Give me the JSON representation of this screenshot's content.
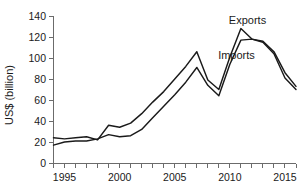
{
  "chart_data": {
    "type": "line",
    "title": "",
    "xlabel": "",
    "ylabel": "US$ (billion)",
    "xlim": [
      1994,
      2016
    ],
    "ylim": [
      0,
      140
    ],
    "grid": false,
    "legend_position": "inline-annotation",
    "x": [
      1994,
      1995,
      1996,
      1997,
      1998,
      1999,
      2000,
      2001,
      2002,
      2003,
      2004,
      2005,
      2006,
      2007,
      2008,
      2009,
      2010,
      2011,
      2012,
      2013,
      2014,
      2015,
      2016
    ],
    "x_tick_labels": [
      "1995",
      "2000",
      "2005",
      "2010",
      "2015"
    ],
    "x_tick_values": [
      1995,
      2000,
      2005,
      2010,
      2015
    ],
    "y_tick_labels": [
      "0",
      "20",
      "40",
      "60",
      "80",
      "100",
      "120",
      "140"
    ],
    "y_tick_values": [
      0,
      20,
      40,
      60,
      80,
      100,
      120,
      140
    ],
    "series": [
      {
        "name": "Exports",
        "label": "Exports",
        "color": "#1a1a1a",
        "values": [
          24,
          23,
          24,
          25,
          22,
          36,
          34,
          38,
          47,
          58,
          68,
          80,
          92,
          106,
          79,
          70,
          101,
          128,
          118,
          116,
          106,
          86,
          73
        ]
      },
      {
        "name": "Imports",
        "label": "Imports",
        "color": "#1a1a1a",
        "values": [
          17,
          20,
          21,
          21,
          23,
          27,
          25,
          26,
          32,
          43,
          54,
          65,
          77,
          91,
          74,
          64,
          94,
          117,
          118,
          115,
          104,
          81,
          70
        ]
      }
    ],
    "annotations": [
      {
        "text": "Exports",
        "x": 2011.6,
        "y": 132
      },
      {
        "text": "Imports",
        "x": 2010.6,
        "y": 99
      }
    ]
  },
  "axis": {
    "y_axis_title": "US$ (billion)"
  }
}
